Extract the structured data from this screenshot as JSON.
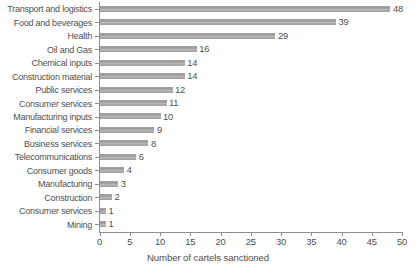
{
  "chart_data": {
    "type": "bar",
    "orientation": "horizontal",
    "title": "",
    "xlabel": "Number of cartels sanctioned",
    "ylabel": "",
    "xlim": [
      0,
      50
    ],
    "xticks": [
      0,
      5,
      10,
      15,
      20,
      25,
      30,
      35,
      40,
      45,
      50
    ],
    "grid": false,
    "legend": null,
    "bar_color": "#9b9b9b",
    "axis_color": "#8e8e8e",
    "text_color": "#4f4f4f",
    "categories": [
      "Transport and logistics",
      "Food and beverages",
      "Health",
      "Oil and Gas",
      "Chemical inputs",
      "Construction material",
      "Public services",
      "Consumer services",
      "Manufacturing inputs",
      "Financial services",
      "Business services",
      "Telecommunications",
      "Consumer goods",
      "Manufacturing",
      "Construction",
      "Consumer services",
      "Mining"
    ],
    "values": [
      48,
      39,
      29,
      16,
      14,
      14,
      12,
      11,
      10,
      9,
      8,
      6,
      4,
      3,
      2,
      1,
      1
    ],
    "data_labels": [
      "48",
      "39",
      "29",
      "16",
      "14",
      "14",
      "12",
      "11",
      "10",
      "9",
      "8",
      "6",
      "4",
      "3",
      "2",
      "1",
      "1"
    ]
  }
}
